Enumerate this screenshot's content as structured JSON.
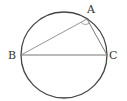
{
  "diagram": {
    "type": "geometry",
    "circle": {
      "cx": 64,
      "cy": 55,
      "r": 43
    },
    "points": {
      "A": {
        "label": "A",
        "x": 87,
        "y": 19
      },
      "B": {
        "label": "B",
        "x": 21,
        "y": 55
      },
      "C": {
        "label": "C",
        "x": 107,
        "y": 55
      }
    },
    "segments": [
      "AB",
      "AC",
      "BC"
    ],
    "angle_mark": {
      "vertex": "A",
      "style": "arc"
    },
    "colors": {
      "stroke": "#444444",
      "thin_stroke": "#777777",
      "label": "#333333"
    }
  }
}
